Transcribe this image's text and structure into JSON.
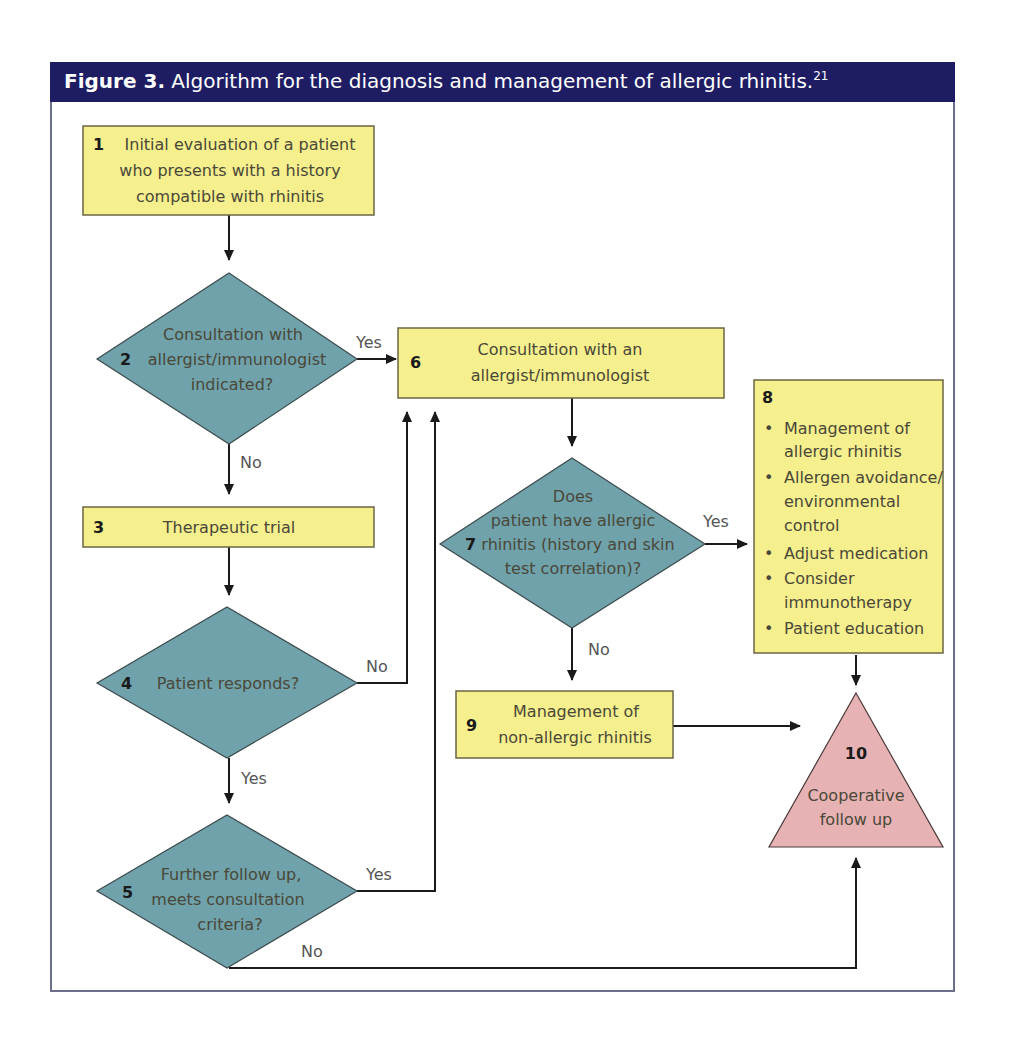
{
  "figure": {
    "number_label": "Figure 3.",
    "title": "Algorithm for the diagnosis and management of allergic rhinitis.",
    "reference": "21",
    "colors": {
      "title_bar": "#1e1d63",
      "action_box": "#f6ef8e",
      "decision_diamond": "#6fa2ab",
      "terminal_triangle": "#e7b2b4"
    }
  },
  "nodes": {
    "n1": {
      "num": "1",
      "lines": [
        "Initial evaluation of a patient",
        "who presents with a history",
        "compatible with rhinitis"
      ],
      "shape": "box"
    },
    "n2": {
      "num": "2",
      "lines": [
        "Consultation with",
        "allergist/immunologist",
        "indicated?"
      ],
      "shape": "diamond"
    },
    "n3": {
      "num": "3",
      "lines": [
        "Therapeutic trial"
      ],
      "shape": "box"
    },
    "n4": {
      "num": "4",
      "lines": [
        "Patient responds?"
      ],
      "shape": "diamond"
    },
    "n5": {
      "num": "5",
      "lines": [
        "Further follow up,",
        "meets consultation",
        "criteria?"
      ],
      "shape": "diamond"
    },
    "n6": {
      "num": "6",
      "lines": [
        "Consultation with an",
        "allergist/immunologist"
      ],
      "shape": "box"
    },
    "n7": {
      "num": "7",
      "lines": [
        "Does",
        "patient have allergic",
        "rhinitis (history and skin",
        "test correlation)?"
      ],
      "shape": "diamond"
    },
    "n8": {
      "num": "8",
      "bullets": [
        [
          "Management of",
          "allergic rhinitis"
        ],
        [
          "Allergen avoidance/",
          "environmental",
          "control"
        ],
        [
          "Adjust medication"
        ],
        [
          "Consider",
          "immunotherapy"
        ],
        [
          "Patient education"
        ]
      ],
      "shape": "box"
    },
    "n9": {
      "num": "9",
      "lines": [
        "Management of",
        "non-allergic rhinitis"
      ],
      "shape": "box"
    },
    "n10": {
      "num": "10",
      "lines": [
        "Cooperative",
        "follow up"
      ],
      "shape": "triangle"
    }
  },
  "edges": {
    "e1_2": {
      "from": "1",
      "to": "2",
      "label": ""
    },
    "e2_6": {
      "from": "2",
      "to": "6",
      "label": "Yes"
    },
    "e2_3": {
      "from": "2",
      "to": "3",
      "label": "No"
    },
    "e3_4": {
      "from": "3",
      "to": "4",
      "label": ""
    },
    "e4_6": {
      "from": "4",
      "to": "6",
      "label": "No"
    },
    "e4_5": {
      "from": "4",
      "to": "5",
      "label": "Yes"
    },
    "e5_6": {
      "from": "5",
      "to": "6",
      "label": "Yes"
    },
    "e5_10": {
      "from": "5",
      "to": "10",
      "label": "No"
    },
    "e6_7": {
      "from": "6",
      "to": "7",
      "label": ""
    },
    "e7_8": {
      "from": "7",
      "to": "8",
      "label": "Yes"
    },
    "e7_9": {
      "from": "7",
      "to": "9",
      "label": "No"
    },
    "e8_10": {
      "from": "8",
      "to": "10",
      "label": ""
    },
    "e9_10": {
      "from": "9",
      "to": "10",
      "label": ""
    }
  }
}
